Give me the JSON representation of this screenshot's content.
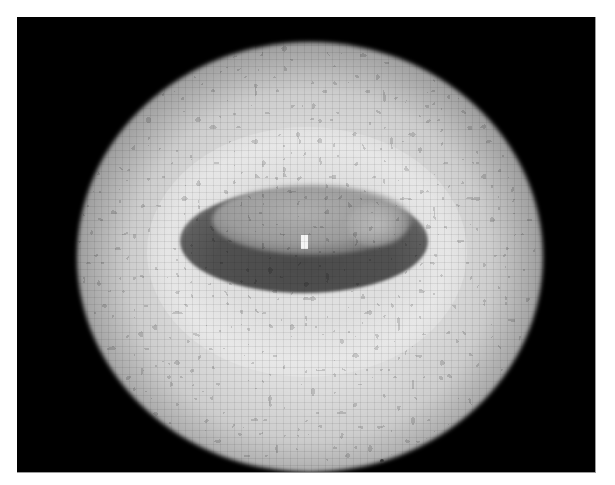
{
  "image": {
    "description": "Pixelated grayscale intensity image: bright diffuse elliptical halo on black background with a dark elliptical ring-shaped region near center and a single bright pixel spot",
    "colors": {
      "background": "#ffffff",
      "panel": "#000000",
      "halo_peak": "#e0e0e0",
      "inner_dark": "#4b4b4b",
      "bright_spot": "#f4f4f4"
    }
  }
}
